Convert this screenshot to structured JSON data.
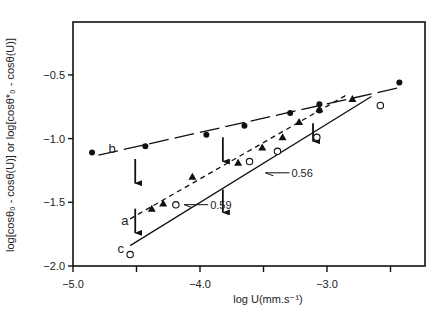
{
  "chart_data": {
    "type": "scatter",
    "title": "",
    "xlabel": "log U(mm.s⁻¹)",
    "ylabel": "log[cosθ₀ - cosθ(U)] or log[cosθ*₀ - cosθ(U)]",
    "xlim": [
      -5.0,
      -2.2
    ],
    "ylim": [
      -2.0,
      -0.2
    ],
    "x_ticks": [
      -5.0,
      -4.5,
      -4.0,
      -3.5,
      -3.0,
      -2.5
    ],
    "x_tick_labels": [
      "-5.0",
      "",
      "-4.0",
      "",
      "-3.0",
      ""
    ],
    "y_ticks": [
      -2.0,
      -1.5,
      -1.0,
      -0.5
    ],
    "y_tick_labels": [
      "-2.0",
      "-1.5",
      "-1.0",
      "-0.5"
    ],
    "grid": false,
    "legend": "none (series labelled a, b, c inline)",
    "series": [
      {
        "name": "a",
        "marker": "filled-triangle",
        "line": "short-dashed",
        "x": [
          -4.38,
          -4.29,
          -4.06,
          -3.7,
          -3.51,
          -3.35,
          -3.22,
          -3.06,
          -2.8
        ],
        "y": [
          -1.55,
          -1.51,
          -1.3,
          -1.19,
          -1.07,
          -0.99,
          -0.87,
          -0.77,
          -0.69
        ],
        "fit": {
          "x": [
            -4.55,
            -2.85
          ],
          "y": [
            -1.63,
            -0.66
          ]
        }
      },
      {
        "name": "b",
        "marker": "filled-circle",
        "line": "long-dashed",
        "x": [
          -4.85,
          -4.43,
          -3.95,
          -3.65,
          -3.29,
          -3.06,
          -3.06,
          -2.43
        ],
        "y": [
          -1.11,
          -1.06,
          -0.97,
          -0.9,
          -0.8,
          -0.73,
          -0.78,
          -0.56
        ],
        "fit": {
          "x": [
            -4.8,
            -2.43
          ],
          "y": [
            -1.13,
            -0.6
          ]
        }
      },
      {
        "name": "c",
        "marker": "open-circle",
        "line": "solid",
        "x": [
          -4.55,
          -4.19,
          -3.61,
          -3.39,
          -3.08,
          -2.58
        ],
        "y": [
          -1.91,
          -1.52,
          -1.18,
          -1.1,
          -0.99,
          -0.74
        ],
        "fit": {
          "x": [
            -4.55,
            -2.65
          ],
          "y": [
            -1.84,
            -0.67
          ]
        }
      }
    ],
    "annotations": [
      {
        "text": "0.59",
        "x": -3.92,
        "y": -1.55,
        "points_to_line": "c (lower segment)"
      },
      {
        "text": "0.56",
        "x": -3.28,
        "y": -1.3,
        "points_to_line": "c (upper segment)"
      },
      {
        "text": "a",
        "x": -4.62,
        "y": -1.68
      },
      {
        "text": "b",
        "x": -4.72,
        "y": -1.11
      },
      {
        "text": "c",
        "x": -4.65,
        "y": -1.9
      }
    ],
    "arrows": [
      {
        "x": -4.51,
        "y_from": -1.16,
        "y_to": -1.35
      },
      {
        "x": -3.82,
        "y_from": -0.99,
        "y_to": -1.18
      },
      {
        "x": -4.51,
        "y_from": -1.55,
        "y_to": -1.74
      },
      {
        "x": -3.82,
        "y_from": -1.4,
        "y_to": -1.58
      },
      {
        "x": -3.11,
        "y_from": -0.88,
        "y_to": -1.02
      }
    ]
  }
}
